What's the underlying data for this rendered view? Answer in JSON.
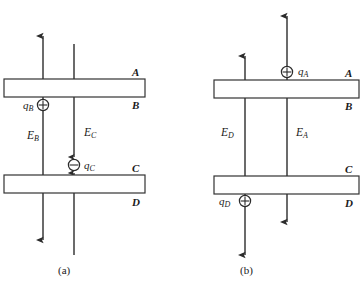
{
  "figure": {
    "stroke_color": "#333333",
    "plate_fill": "#ffffff",
    "background": "#ffffff"
  },
  "panels": [
    {
      "id": "a",
      "caption": "(a)",
      "plates": [
        {
          "name": "top-plate",
          "label_above": "A",
          "label_below": "B"
        },
        {
          "name": "bottom-plate",
          "label_above": "C",
          "label_below": "D"
        }
      ],
      "charges": [
        {
          "name": "q-B",
          "label": "q",
          "subscript": "B",
          "sign": "+",
          "glyph": "oplus",
          "location": "just below top plate"
        },
        {
          "name": "q-C",
          "label": "q",
          "subscript": "C",
          "sign": "-",
          "glyph": "ominus",
          "location": "just above bottom plate"
        }
      ],
      "fields": [
        {
          "name": "E-B",
          "label": "E",
          "subscript": "B",
          "direction": "bidirectional-vertical",
          "arrow_top": "up",
          "arrow_bottom": "down"
        },
        {
          "name": "E-C",
          "label": "E",
          "subscript": "C",
          "direction": "converging-on-charge",
          "arrow_top": "none",
          "arrow_bottom": "none"
        }
      ]
    },
    {
      "id": "b",
      "caption": "(b)",
      "plates": [
        {
          "name": "top-plate",
          "label_above": "A",
          "label_below": "B"
        },
        {
          "name": "bottom-plate",
          "label_above": "C",
          "label_below": "D"
        }
      ],
      "charges": [
        {
          "name": "q-A",
          "label": "q",
          "subscript": "A",
          "sign": "+",
          "glyph": "oplus",
          "location": "just above top plate"
        },
        {
          "name": "q-D",
          "label": "q",
          "subscript": "D",
          "sign": "+",
          "glyph": "oplus",
          "location": "just below bottom plate"
        }
      ],
      "fields": [
        {
          "name": "E-D",
          "label": "E",
          "subscript": "D",
          "direction": "bidirectional-vertical",
          "arrow_top": "up",
          "arrow_bottom": "down"
        },
        {
          "name": "E-A",
          "label": "E",
          "subscript": "A",
          "direction": "bidirectional-vertical",
          "arrow_top": "up",
          "arrow_bottom": "down"
        }
      ]
    }
  ],
  "labels": {
    "panel_a": {
      "plate_A": "A",
      "plate_B": "B",
      "plate_C": "C",
      "plate_D": "D",
      "E_B": "E",
      "E_B_sub": "B",
      "E_C": "E",
      "E_C_sub": "C",
      "q_B": "q",
      "q_B_sub": "B",
      "q_C": "q",
      "q_C_sub": "C",
      "caption": "(a)"
    },
    "panel_b": {
      "plate_A": "A",
      "plate_B": "B",
      "plate_C": "C",
      "plate_D": "D",
      "E_D": "E",
      "E_D_sub": "D",
      "E_A": "E",
      "E_A_sub": "A",
      "q_A": "q",
      "q_A_sub": "A",
      "q_D": "q",
      "q_D_sub": "D",
      "caption": "(b)"
    }
  }
}
